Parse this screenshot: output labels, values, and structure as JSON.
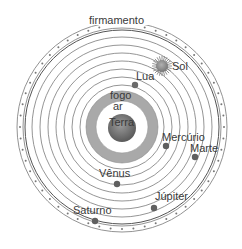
{
  "colors": {
    "orbit": "#6e6e6e",
    "ring_fill": "#a9a9a9",
    "earth_fill": "#7a7a7a",
    "planet_fill": "#5f5f5f",
    "sun_fill": "#8f8f8f",
    "text": "#3a3a3a"
  },
  "labels": {
    "firmament": "firmamento",
    "sun": "Sol",
    "moon": "Lua",
    "fire": "fogo",
    "air": "ar",
    "earth": "Terra",
    "mercury": "Mercúrio",
    "venus": "Vênus",
    "mars": "Marte",
    "jupiter": "Júpiter",
    "saturn": "Saturno"
  }
}
